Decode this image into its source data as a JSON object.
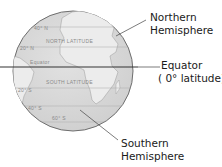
{
  "diagram": {
    "globe_labels": {
      "north_latitude": "NORTH LATITUDE",
      "south_latitude": "SOUTH LATITUDE",
      "equator_small": "Equator",
      "lat_n1": "40° N",
      "lat_n2": "20° N",
      "lat_s1": "20° S",
      "lat_s2": "40° S",
      "lat_s3": "60° S"
    },
    "callouts": {
      "northern": {
        "line1": "Northern",
        "line2": "Hemisphere"
      },
      "equator": {
        "line1": "Equator",
        "line2": "( 0° latitude)"
      },
      "southern": {
        "line1": "Southern",
        "line2": "Hemisphere"
      }
    },
    "colors": {
      "ocean": "#d9d9d9",
      "land": "#e8e8e8",
      "outline": "#6e6e6e",
      "equator_line": "#333333",
      "leader_line": "#444444",
      "text": "#1a1a1a"
    }
  }
}
